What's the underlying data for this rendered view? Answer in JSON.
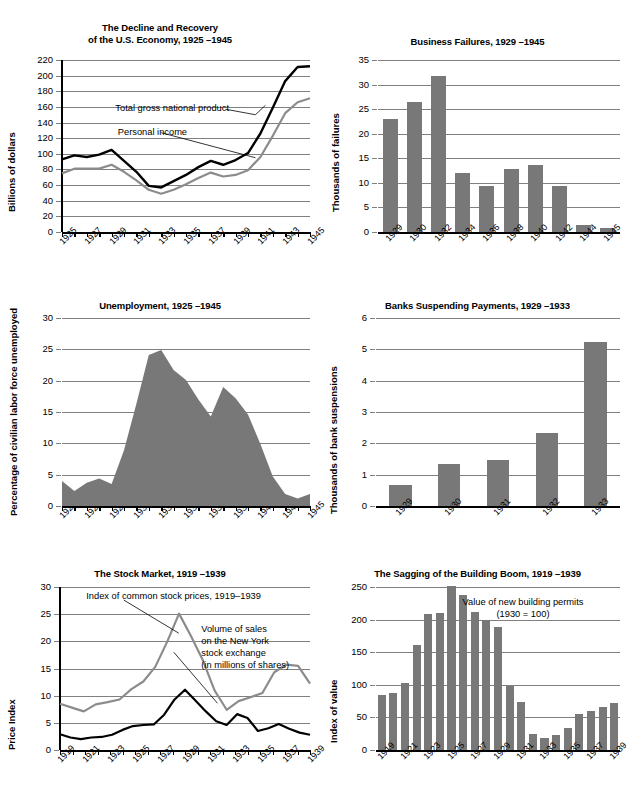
{
  "figure": {
    "background": "#ffffff",
    "bar_color": "#787878",
    "line_black": "#000000",
    "line_gray": "#8c8c8c",
    "grid_color": "#808080"
  },
  "charts": [
    {
      "id": "decline-recovery",
      "chart_data": {
        "type": "line",
        "title": "The Decline and Recovery\nof the U.S. Economy, 1925 –1945",
        "title_line1": "The Decline and Recovery",
        "title_line2": "of the U.S. Economy, 1925 –1945",
        "xlabel": "",
        "ylabel": "Billions of dollars",
        "ylim": [
          0,
          220
        ],
        "yticks": [
          0,
          20,
          40,
          60,
          80,
          100,
          120,
          140,
          160,
          180,
          200,
          220
        ],
        "grid": true,
        "legend": "annotations",
        "x": [
          1925,
          1926,
          1927,
          1928,
          1929,
          1930,
          1931,
          1932,
          1933,
          1934,
          1935,
          1936,
          1937,
          1938,
          1939,
          1940,
          1941,
          1942,
          1943,
          1944,
          1945
        ],
        "tick_labels": [
          "1925",
          "1927",
          "1929",
          "1931",
          "1933",
          "1935",
          "1937",
          "1939",
          "1941",
          "1943",
          "1945"
        ],
        "series": [
          {
            "name": "Total gross national product",
            "color": "#000000",
            "values": [
              93,
              98,
              96,
              99,
              105,
              91,
              77,
              59,
              57,
              65,
              73,
              83,
              91,
              86,
              92,
              101,
              126,
              159,
              193,
              211,
              212
            ]
          },
          {
            "name": "Personal income",
            "color": "#8c8c8c",
            "values": [
              75,
              81,
              81,
              81,
              86,
              77,
              66,
              54,
              49,
              54,
              61,
              69,
              76,
              71,
              73,
              79,
              96,
              123,
              152,
              166,
              171
            ]
          }
        ],
        "annotations": [
          {
            "text": "Total gross national product",
            "x": 1930,
            "y": 160
          },
          {
            "text": "Personal income",
            "x": 1930.5,
            "y": 130
          }
        ]
      }
    },
    {
      "id": "business-failures",
      "chart_data": {
        "type": "bar",
        "title": "Business Failures, 1929 –1945",
        "xlabel": "",
        "ylabel": "Thousands of failures",
        "ylim": [
          0,
          35
        ],
        "yticks": [
          0,
          5,
          10,
          15,
          20,
          25,
          30,
          35
        ],
        "grid": true,
        "categories": [
          "1929",
          "1930",
          "1932",
          "1934",
          "1936",
          "1938",
          "1940",
          "1942",
          "1944",
          "1945"
        ],
        "values": [
          23.0,
          26.5,
          31.8,
          12.0,
          9.4,
          12.8,
          13.7,
          9.4,
          1.5,
          0.8
        ]
      }
    },
    {
      "id": "unemployment",
      "chart_data": {
        "type": "area",
        "title": "Unemployment, 1925 –1945",
        "xlabel": "",
        "ylabel": "Percentage of civilian labor force unemployed",
        "ylim": [
          0,
          30
        ],
        "yticks": [
          0,
          5,
          10,
          15,
          20,
          25,
          30
        ],
        "grid": true,
        "x": [
          1925,
          1926,
          1927,
          1928,
          1929,
          1930,
          1931,
          1932,
          1933,
          1934,
          1935,
          1936,
          1937,
          1938,
          1939,
          1940,
          1941,
          1942,
          1943,
          1944,
          1945
        ],
        "tick_labels": [
          "1925",
          "1927",
          "1929",
          "1931",
          "1933",
          "1935",
          "1937",
          "1939",
          "1941",
          "1943",
          "1945"
        ],
        "values": [
          4.0,
          2.4,
          3.7,
          4.4,
          3.5,
          8.9,
          16.3,
          24.1,
          24.9,
          21.7,
          20.1,
          17.0,
          14.3,
          19.0,
          17.2,
          14.6,
          9.9,
          4.7,
          1.9,
          1.2,
          1.9
        ]
      }
    },
    {
      "id": "banks-suspending",
      "chart_data": {
        "type": "bar",
        "title": "Banks Suspending Payments, 1929 –1933",
        "xlabel": "",
        "ylabel": "Thousands of bank suspensions",
        "ylim": [
          0,
          6
        ],
        "yticks": [
          0,
          1,
          2,
          3,
          4,
          5,
          6
        ],
        "grid": true,
        "categories": [
          "1929",
          "1930",
          "1931",
          "1932",
          "1933"
        ],
        "values": [
          0.66,
          1.35,
          1.47,
          2.33,
          5.22
        ]
      }
    },
    {
      "id": "stock-market",
      "chart_data": {
        "type": "line",
        "title": "The Stock Market, 1919 –1939",
        "xlabel": "",
        "ylabel": "Price Index",
        "ylim": [
          0,
          30
        ],
        "yticks": [
          0,
          5,
          10,
          15,
          20,
          25,
          30
        ],
        "grid": true,
        "x": [
          1919,
          1920,
          1921,
          1922,
          1923,
          1924,
          1925,
          1926,
          1927,
          1928,
          1929,
          1930,
          1931,
          1932,
          1933,
          1934,
          1935,
          1936,
          1937,
          1938,
          1939
        ],
        "tick_labels": [
          "1919",
          "1921",
          "1923",
          "1925",
          "1927",
          "1929",
          "1931",
          "1933",
          "1935",
          "1937",
          "1939"
        ],
        "series": [
          {
            "name": "Index of common stock prices, 1919–1939",
            "color": "#8c8c8c",
            "values": [
              8.5,
              7.8,
              7.1,
              8.4,
              8.8,
              9.3,
              11.2,
              12.6,
              15.3,
              19.9,
              25.1,
              21.0,
              16.5,
              10.9,
              7.4,
              9.0,
              9.7,
              10.5,
              14.3,
              15.7,
              15.5,
              12.2
            ]
          },
          {
            "name": "Volume of sales on the New York stock exchange (in millions of shares)",
            "color": "#000000",
            "values": [
              2.9,
              2.3,
              2.0,
              2.3,
              2.4,
              2.8,
              3.7,
              4.4,
              4.6,
              4.7,
              6.5,
              9.3,
              11.1,
              9.1,
              7.1,
              5.3,
              4.6,
              6.6,
              5.9,
              3.5,
              4.0,
              4.8,
              3.9,
              3.2,
              2.8
            ]
          }
        ],
        "annotations": [
          {
            "text": "Index of common stock prices, 1919–1939"
          },
          {
            "text": "Volume of sales\non the New York\nstock exchange\n(in millions of shares)"
          }
        ]
      }
    },
    {
      "id": "building-boom",
      "chart_data": {
        "type": "bar",
        "title": "The Sagging of the Building Boom, 1919 –1939",
        "xlabel": "",
        "ylabel": "Index of value",
        "ylim": [
          0,
          250
        ],
        "yticks": [
          0,
          50,
          100,
          150,
          200,
          250
        ],
        "grid": true,
        "categories": [
          "1919",
          "1920",
          "1921",
          "1922",
          "1923",
          "1924",
          "1925",
          "1926",
          "1927",
          "1928",
          "1929",
          "1930",
          "1931",
          "1932",
          "1933",
          "1934",
          "1935",
          "1936",
          "1937",
          "1938",
          "1939"
        ],
        "tick_labels": [
          "1919",
          "1921",
          "1923",
          "1925",
          "1927",
          "1929",
          "1931",
          "1933",
          "1935",
          "1937",
          "1939"
        ],
        "values": [
          84,
          87,
          103,
          161,
          209,
          210,
          251,
          238,
          211,
          200,
          188,
          98,
          73,
          24,
          18,
          23,
          34,
          56,
          60,
          66,
          72
        ],
        "annotations": [
          {
            "text": "Value of new building permits\n(1930 = 100)",
            "line1": "Value of new building permits",
            "line2": "(1930 = 100)"
          }
        ]
      }
    }
  ]
}
